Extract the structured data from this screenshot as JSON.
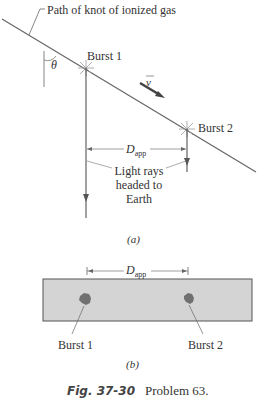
{
  "panel_a": {
    "path_label": "Path of knot of ionized gas",
    "theta_label": "θ",
    "velocity_label": "v",
    "burst1_label": "Burst 1",
    "burst2_label": "Burst 2",
    "dapp_label": "D",
    "dapp_sub": "app",
    "light_rays_label_line1": "Light rays",
    "light_rays_label_line2": "headed to",
    "light_rays_label_line3": "Earth",
    "panel_label": "(a)"
  },
  "panel_b": {
    "dapp_label": "D",
    "dapp_sub": "app",
    "burst1_label": "Burst 1",
    "burst2_label": "Burst 2",
    "panel_label": "(b)",
    "photo_bg": "#d4d4d4",
    "blob_color": "#707070"
  },
  "caption": {
    "figure_number": "Fig. 37-30",
    "problem": "Problem 63."
  }
}
